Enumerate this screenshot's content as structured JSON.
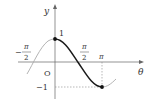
{
  "diagram": {
    "function": "y = cos θ",
    "axes": {
      "x_label": "θ",
      "y_label": "y",
      "origin_label": "O"
    },
    "tick_labels": {
      "neg_half_pi_num": "π",
      "neg_half_pi_den": "2",
      "neg_sign": "−",
      "half_pi_num": "π",
      "half_pi_den": "2",
      "pi": "π",
      "one": "1",
      "neg_one": "−1"
    },
    "highlighted_points": [
      {
        "theta": "0",
        "y": "1"
      },
      {
        "theta": "π",
        "y": "-1"
      }
    ],
    "highlighted_interval": "0 ≤ θ ≤ π",
    "colors": {
      "highlight_curve": "#1a1a1a",
      "context_curve": "#a8a8a8",
      "axes": "#555555",
      "guide_dashes": "#777777"
    }
  }
}
